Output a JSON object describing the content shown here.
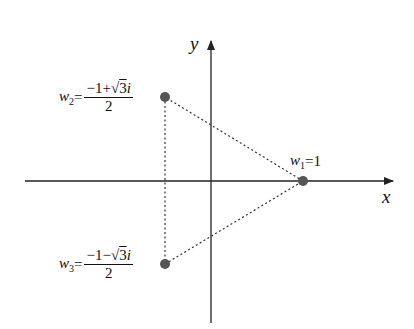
{
  "diagram": {
    "type": "complex-plane-cube-roots-of-unity",
    "axes": {
      "x_label": "x",
      "y_label": "y"
    },
    "points": [
      {
        "id": "w1",
        "name": "w",
        "subscript": "1",
        "value": "1",
        "label": "w1=1"
      },
      {
        "id": "w2",
        "name": "w",
        "subscript": "2",
        "numerator": "−1+√3i",
        "numerator_prefix": "−1+",
        "sqrt_arg": "3",
        "numerator_suffix": "i",
        "denominator": "2",
        "label": "w2=(−1+√3i)/2"
      },
      {
        "id": "w3",
        "name": "w",
        "subscript": "3",
        "numerator": "−1−√3i",
        "numerator_prefix": "−1−",
        "sqrt_arg": "3",
        "numerator_suffix": "i",
        "denominator": "2",
        "label": "w3=(−1−√3i)/2"
      }
    ],
    "edges": [
      {
        "from": "w1",
        "to": "w2",
        "style": "dotted"
      },
      {
        "from": "w2",
        "to": "w3",
        "style": "dotted"
      },
      {
        "from": "w3",
        "to": "w1",
        "style": "dotted"
      }
    ],
    "colors": {
      "axis": "#222222",
      "point": "#555555",
      "edge": "#333333"
    }
  }
}
